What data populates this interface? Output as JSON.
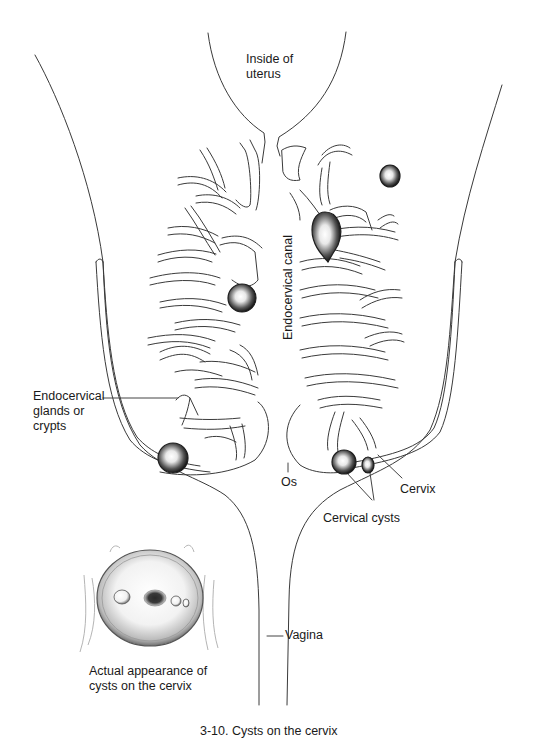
{
  "figure": {
    "type": "anatomical-line-drawing",
    "subject": "Cysts on the cervix",
    "caption": "3-10. Cysts on the cervix"
  },
  "labels": {
    "inside_uterus": [
      "Inside of",
      "uterus"
    ],
    "endocervical_canal": "Endocervical canal",
    "endocervical_glands": [
      "Endocervical",
      "glands or",
      "crypts"
    ],
    "os": "Os",
    "cervix": "Cervix",
    "cervical_cysts": "Cervical cysts",
    "vagina": "Vagina",
    "inset_caption": [
      "Actual appearance of",
      "cysts on the cervix"
    ]
  },
  "colors": {
    "line": "#3a3a3a",
    "cyst_dark": "#1e1e1e",
    "background": "#ffffff",
    "text": "#1a1a1a"
  }
}
